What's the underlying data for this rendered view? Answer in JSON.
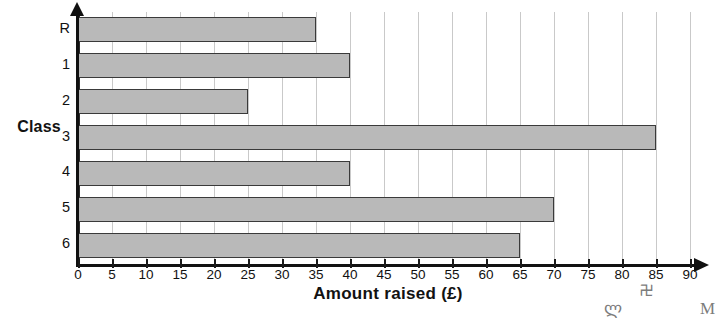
{
  "chart_data": {
    "type": "bar",
    "orientation": "horizontal",
    "title": "",
    "xlabel": "Amount raised (£)",
    "ylabel": "Class",
    "categories": [
      "R",
      "1",
      "2",
      "3",
      "4",
      "5",
      "6"
    ],
    "values": [
      35,
      40,
      25,
      85,
      40,
      70,
      65
    ],
    "xlim": [
      0,
      90
    ],
    "xticks": [
      0,
      5,
      10,
      15,
      20,
      25,
      30,
      35,
      40,
      45,
      50,
      55,
      60,
      65,
      70,
      75,
      80,
      85,
      90
    ],
    "xtick_labels": [
      "0",
      "5",
      "10",
      "15",
      "20",
      "25",
      "30",
      "35",
      "40",
      "45",
      "50",
      "55",
      "60",
      "65",
      "70",
      "75",
      "80",
      "85",
      "90"
    ],
    "grid": true,
    "grid_axis": "x",
    "legend": null,
    "bar_color": "#b9b9b9",
    "bar_edge_color": "#3a3a3a",
    "grid_color": "#c9c9c9",
    "axis_color": "#111111"
  },
  "artifacts": [
    {
      "glyph": "ლ",
      "left": 604
    },
    {
      "glyph": "࿖",
      "left": 640
    },
    {
      "glyph": "M",
      "left": 700
    }
  ]
}
